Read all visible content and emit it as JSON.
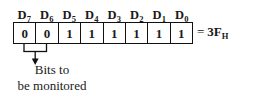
{
  "diagram": {
    "bit_labels": [
      {
        "name": "D",
        "index": "7"
      },
      {
        "name": "D",
        "index": "6"
      },
      {
        "name": "D",
        "index": "5"
      },
      {
        "name": "D",
        "index": "4"
      },
      {
        "name": "D",
        "index": "3"
      },
      {
        "name": "D",
        "index": "2"
      },
      {
        "name": "D",
        "index": "1"
      },
      {
        "name": "D",
        "index": "0"
      }
    ],
    "bit_values": [
      "0",
      "0",
      "1",
      "1",
      "1",
      "1",
      "1",
      "1"
    ],
    "hex_annotation": {
      "equals": "=",
      "value": "3F",
      "base_subscript": "H"
    },
    "callout": {
      "line1": "Bits to",
      "line2": "be monitored",
      "points_to_bits": [
        "D7",
        "D6"
      ]
    },
    "colors": {
      "ink": "#111111",
      "background": "#ffffff"
    }
  }
}
